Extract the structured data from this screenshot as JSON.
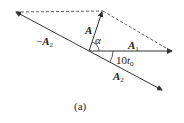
{
  "diagram": {
    "caption": "(a)",
    "labels": {
      "A": "A",
      "alpha": "α",
      "A1": "A",
      "A1_sub": "1",
      "neg_A2_prefix": "−",
      "neg_A2": "A",
      "neg_A2_sub": "2",
      "A2": "A",
      "A2_sub": "2",
      "angle_num": "10",
      "angle_var": "t",
      "angle_sub": "0"
    },
    "colors": {
      "line": "#333333"
    }
  }
}
